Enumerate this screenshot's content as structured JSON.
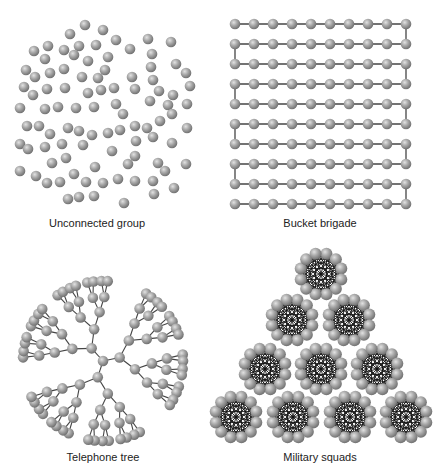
{
  "style": {
    "node_fill_light": "#d8d8d8",
    "node_fill_mid": "#a6a6a6",
    "node_fill_dark": "#6e6e6e",
    "edge_color": "#444444",
    "mesh_edge_color": "#111111"
  },
  "panels": [
    {
      "id": "unconnected",
      "caption": "Unconnected group",
      "caption_pos": [
        97,
        224
      ],
      "type": "scatter",
      "node_radius": 5.3,
      "nodes": [
        [
          85,
          25
        ],
        [
          103,
          30
        ],
        [
          70,
          34
        ],
        [
          116,
          40
        ],
        [
          34,
          51
        ],
        [
          48,
          46
        ],
        [
          64,
          50
        ],
        [
          79,
          46
        ],
        [
          96,
          45
        ],
        [
          108,
          57
        ],
        [
          130,
          49
        ],
        [
          148,
          39
        ],
        [
          171,
          42
        ],
        [
          45,
          59
        ],
        [
          74,
          55
        ],
        [
          88,
          61
        ],
        [
          105,
          70
        ],
        [
          152,
          54
        ],
        [
          26,
          70
        ],
        [
          35,
          77
        ],
        [
          50,
          73
        ],
        [
          64,
          69
        ],
        [
          82,
          77
        ],
        [
          98,
          78
        ],
        [
          132,
          77
        ],
        [
          151,
          67
        ],
        [
          176,
          64
        ],
        [
          186,
          73
        ],
        [
          24,
          87
        ],
        [
          33,
          95
        ],
        [
          47,
          89
        ],
        [
          65,
          88
        ],
        [
          88,
          93
        ],
        [
          101,
          90
        ],
        [
          114,
          88
        ],
        [
          135,
          89
        ],
        [
          153,
          80
        ],
        [
          159,
          91
        ],
        [
          173,
          95
        ],
        [
          190,
          86
        ],
        [
          20,
          108
        ],
        [
          45,
          109
        ],
        [
          58,
          107
        ],
        [
          76,
          108
        ],
        [
          94,
          107
        ],
        [
          116,
          104
        ],
        [
          123,
          114
        ],
        [
          150,
          101
        ],
        [
          168,
          105
        ],
        [
          187,
          104
        ],
        [
          27,
          126
        ],
        [
          39,
          126
        ],
        [
          50,
          134
        ],
        [
          68,
          128
        ],
        [
          79,
          131
        ],
        [
          92,
          135
        ],
        [
          108,
          133
        ],
        [
          120,
          130
        ],
        [
          135,
          126
        ],
        [
          147,
          128
        ],
        [
          160,
          121
        ],
        [
          172,
          114
        ],
        [
          187,
          128
        ],
        [
          20,
          144
        ],
        [
          28,
          149
        ],
        [
          45,
          147
        ],
        [
          62,
          144
        ],
        [
          83,
          145
        ],
        [
          112,
          151
        ],
        [
          136,
          141
        ],
        [
          153,
          137
        ],
        [
          172,
          143
        ],
        [
          52,
          163
        ],
        [
          66,
          158
        ],
        [
          95,
          167
        ],
        [
          128,
          164
        ],
        [
          135,
          156
        ],
        [
          158,
          163
        ],
        [
          165,
          171
        ],
        [
          186,
          164
        ],
        [
          20,
          171
        ],
        [
          36,
          176
        ],
        [
          47,
          183
        ],
        [
          60,
          182
        ],
        [
          74,
          174
        ],
        [
          86,
          182
        ],
        [
          103,
          183
        ],
        [
          118,
          179
        ],
        [
          135,
          181
        ],
        [
          153,
          181
        ],
        [
          174,
          188
        ],
        [
          68,
          199
        ],
        [
          79,
          197
        ],
        [
          94,
          196
        ],
        [
          154,
          194
        ],
        [
          124,
          203
        ]
      ]
    },
    {
      "id": "bucket",
      "caption": "Bucket brigade",
      "caption_pos": [
        320,
        224
      ],
      "type": "chain-grid",
      "node_radius": 5.3,
      "cols": 10,
      "rows": 10,
      "x0": 235,
      "dx": 19,
      "y0": 24,
      "dy": 20
    },
    {
      "id": "tree",
      "caption": "Telephone tree",
      "caption_pos": [
        103,
        458
      ],
      "type": "radial-tree",
      "node_radius": 5.3,
      "root": [
        103,
        361
      ],
      "start_angle_deg": -72,
      "branching": [
        3,
        2,
        2,
        2,
        2
      ],
      "radii": [
        0,
        17,
        33,
        49,
        64,
        80
      ],
      "sector_fill": 0.88
    },
    {
      "id": "squads",
      "caption": "Military squads",
      "caption_pos": [
        320,
        458
      ],
      "type": "clique-groups",
      "node_radius": 6,
      "group_size": 12,
      "group_radius": 21,
      "centers": [
        [
          321,
          274
        ],
        [
          292,
          320
        ],
        [
          349,
          320
        ],
        [
          265,
          369
        ],
        [
          321,
          369
        ],
        [
          377,
          369
        ],
        [
          236,
          417
        ],
        [
          293,
          417
        ],
        [
          350,
          417
        ],
        [
          406,
          417
        ]
      ]
    }
  ]
}
